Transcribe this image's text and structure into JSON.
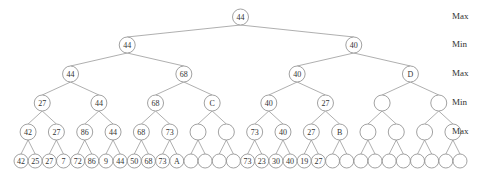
{
  "diagram": {
    "type": "minimax-game-tree",
    "level_labels": [
      {
        "text": "Max",
        "y": 17
      },
      {
        "text": "Min",
        "y": 45
      },
      {
        "text": "Max",
        "y": 74
      },
      {
        "text": "Min",
        "y": 103
      },
      {
        "text": "Max",
        "y": 132
      }
    ],
    "levels": [
      [
        "44"
      ],
      [
        "44",
        "40"
      ],
      [
        "44",
        "68",
        "40",
        "D"
      ],
      [
        "27",
        "44",
        "68",
        "C",
        "40",
        "27",
        "",
        ""
      ],
      [
        "42",
        "27",
        "86",
        "44",
        "68",
        "73",
        "",
        "",
        "73",
        "40",
        "27",
        "B",
        "",
        "",
        "",
        ""
      ],
      [
        "42",
        "25",
        "27",
        "7",
        "72",
        "86",
        "9",
        "44",
        "50",
        "68",
        "73",
        "A",
        "",
        "",
        "",
        "",
        "73",
        "23",
        "30",
        "40",
        "19",
        "27",
        "",
        "",
        "",
        "",
        "",
        "",
        "",
        "",
        "",
        ""
      ]
    ]
  }
}
